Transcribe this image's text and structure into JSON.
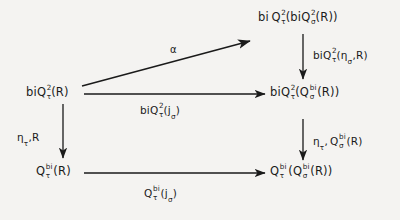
{
  "diagram": {
    "kind": "commutative-diagram",
    "background_color": "#f4f3f1",
    "ink_color": "#1a1a1a",
    "nodes": [
      {
        "id": "top-right",
        "label": "bi Q²τ(biQ²σ(R))",
        "parts": [
          "bi ",
          "Q",
          "2",
          "τ",
          "(bi",
          "Q",
          "2",
          "σ",
          "(R))"
        ]
      },
      {
        "id": "mid-left",
        "label": "biQ²τ(R)"
      },
      {
        "id": "mid-right",
        "label": "biQ²τ(Qbiσ(R))"
      },
      {
        "id": "bottom-left",
        "label": "Qbiτ(R)"
      },
      {
        "id": "bottom-right",
        "label": "Qbiτ(Qbiσ(R))"
      }
    ],
    "edge_labels": {
      "alpha": "α",
      "top_vertical": "biQ²τ(ησ,R)",
      "mid_horizontal": "biQ²τ(jσ)",
      "left_vertical": "ητ,R",
      "right_vertical": "ητ, Qbiσ(R)",
      "bottom_horizontal": "Qbiτ(jσ)"
    },
    "symbols": {
      "bi": "bi",
      "Q": "Q",
      "two": "2",
      "tau": "τ",
      "sigma": "σ",
      "eta": "η",
      "alpha": "α",
      "j": "j",
      "R": "R",
      "lparen": "(",
      "rparen": ")",
      "comma": ",",
      "bi_sup": "bi"
    }
  }
}
